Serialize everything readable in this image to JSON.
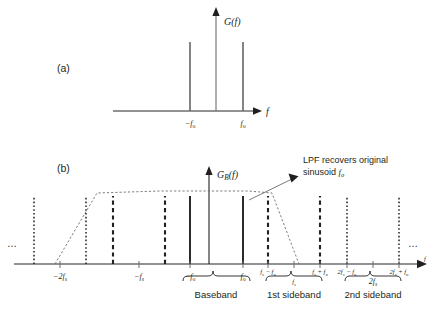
{
  "figure": {
    "width": 436,
    "height": 313,
    "background": "#ffffff",
    "ink_color": "#231f20",
    "axis_color": "#6d6e71"
  },
  "panel_a": {
    "label": "(a)",
    "y_axis_label": "G(f)",
    "x_axis_label": "f",
    "ticks": [
      {
        "label_main": "−f",
        "label_sub": "o",
        "x_value": -1
      },
      {
        "label_main": "f",
        "label_sub": "o",
        "x_value": 1
      }
    ],
    "impulses": [
      {
        "x_value": -1,
        "height": 0.72
      },
      {
        "x_value": 1,
        "height": 0.72
      }
    ]
  },
  "panel_b": {
    "label": "(b)",
    "y_axis_label_main": "G",
    "y_axis_label_sub": "B",
    "y_axis_label_tail": "(f)",
    "x_axis_label": "f",
    "ellipsis_left": "…",
    "ellipsis_right": "…",
    "annotation": {
      "line1": "LPF recovers original",
      "line2_pre": "sinusoid ",
      "line2_main": "f",
      "line2_sub": "o"
    },
    "axis_ticks": [
      {
        "main": "−2f",
        "sub": "s",
        "italic_sub": true
      },
      {
        "main": "−f",
        "sub": "s",
        "italic_sub": true
      },
      {
        "main": "−f",
        "sub": "o",
        "italic_sub": false
      },
      {
        "main": "f",
        "sub": "o",
        "italic_sub": false
      },
      {
        "main": "f",
        "sub": "s",
        "suffix": " − f",
        "suffix_sub": "o",
        "italic_sub": true
      },
      {
        "main": "f",
        "sub": "s",
        "italic_sub": true
      },
      {
        "main": "f",
        "sub": "s",
        "suffix": " + f",
        "suffix_sub": "o",
        "italic_sub": true
      },
      {
        "main": "2f",
        "sub": "s",
        "suffix": " − f",
        "suffix_sub": "o",
        "italic_sub": true
      },
      {
        "main": "2f",
        "sub": "s",
        "italic_sub": true
      },
      {
        "main": "2f",
        "sub": "s",
        "suffix": " + f",
        "suffix_sub": "o",
        "italic_sub": true
      }
    ],
    "braces": [
      {
        "label": "Baseband"
      },
      {
        "label": "1st sideband"
      },
      {
        "label": "2nd sideband"
      }
    ],
    "spectral_lines": [
      {
        "kind": "dotted",
        "note": "-2fs - fo"
      },
      {
        "kind": "dotted",
        "note": "-2fs + fo"
      },
      {
        "kind": "dashed",
        "note": "-fs - fo"
      },
      {
        "kind": "dashed",
        "note": "-fs + fo"
      },
      {
        "kind": "solid",
        "note": "-fo"
      },
      {
        "kind": "solid",
        "note": "+fo"
      },
      {
        "kind": "dashed",
        "note": "fs - fo"
      },
      {
        "kind": "dashed",
        "note": "fs + fo"
      },
      {
        "kind": "dotted",
        "note": "2fs - fo"
      },
      {
        "kind": "dotted",
        "note": "2fs + fo"
      }
    ],
    "lpf_shape": "trapezoid"
  }
}
